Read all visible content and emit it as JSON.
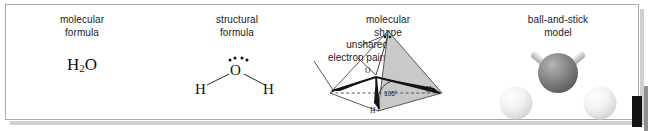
{
  "figure": {
    "background_color": "#ffffff",
    "frame_color": "#a8a8a8",
    "shadow_color": "#cfcfcf",
    "edge_swatch_color": "#131313"
  },
  "panels": [
    {
      "id": "molecular-formula",
      "caption_line1": "molecular",
      "caption_line2": "formula",
      "formula": {
        "element_h": "H",
        "subscript": "2",
        "element_o": "O"
      }
    },
    {
      "id": "structural-formula",
      "caption_line1": "structural",
      "caption_line2": "formula",
      "atoms": {
        "oxygen": "O",
        "hydrogen_left": "H",
        "hydrogen_right": "H"
      },
      "lone_pair_dots": 4
    },
    {
      "id": "molecular-shape",
      "caption_line1": "molecular",
      "caption_line2": "shape",
      "leader_label_line1": "unshared",
      "leader_label_line2": "electron pairs",
      "bond_angle": "105°",
      "atoms": {
        "oxygen": "O",
        "hydrogen_right": "H",
        "hydrogen_front": "H"
      },
      "tetrahedron_fill": "#c9c9c9",
      "tetrahedron_edge": "#4a4a4a"
    },
    {
      "id": "ball-and-stick",
      "caption_line1": "ball-and-stick",
      "caption_line2": "model",
      "oxygen_ball_color": "#7d7d7d",
      "hydrogen_ball_color": "#e9e9e9",
      "bond_stick_color": "#c2c2c2"
    }
  ]
}
